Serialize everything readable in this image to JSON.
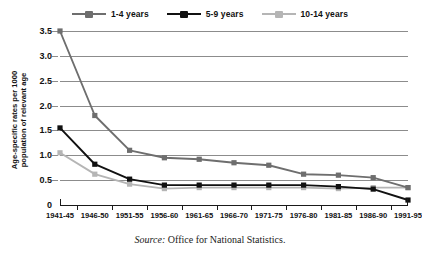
{
  "chart_data": {
    "type": "line",
    "title": "",
    "xlabel": "",
    "ylabel": "Age-specific rates per 1000 population of relevant age",
    "ylabel_line1": "Age-specific rates per 1000",
    "ylabel_line2": "population of relevant age",
    "categories": [
      "1941-45",
      "1946-50",
      "1951-55",
      "1956-60",
      "1961-65",
      "1966-70",
      "1971-75",
      "1976-80",
      "1981-85",
      "1986-90",
      "1991-95"
    ],
    "ylim": [
      0,
      3.5
    ],
    "yticks": [
      0,
      0.5,
      1.0,
      1.5,
      2.0,
      2.5,
      3.0,
      3.5
    ],
    "ytick_labels": [
      "0",
      "0.5",
      "1.0",
      "1.5",
      "2.0",
      "2.5",
      "3.0",
      "3.5"
    ],
    "grid": true,
    "legend_position": "top-center",
    "series": [
      {
        "name": "1-4 years",
        "color": "#6e6e6e",
        "values": [
          3.5,
          1.8,
          1.1,
          0.95,
          0.92,
          0.85,
          0.8,
          0.62,
          0.6,
          0.55,
          0.35
        ]
      },
      {
        "name": "5-9 years",
        "color": "#111111",
        "values": [
          1.55,
          0.82,
          0.52,
          0.4,
          0.4,
          0.4,
          0.4,
          0.4,
          0.37,
          0.32,
          0.1
        ]
      },
      {
        "name": "10-14 years",
        "color": "#b5b5b5",
        "values": [
          1.05,
          0.62,
          0.42,
          0.33,
          0.35,
          0.35,
          0.35,
          0.35,
          0.33,
          0.35,
          0.35
        ]
      }
    ]
  },
  "legend": {
    "items": [
      {
        "label": "1-4 years",
        "color": "#6e6e6e"
      },
      {
        "label": "5-9 years",
        "color": "#111111"
      },
      {
        "label": "10-14 years",
        "color": "#b5b5b5"
      }
    ]
  },
  "source": {
    "prefix": "Source:",
    "text": "Office for National Statistics."
  }
}
